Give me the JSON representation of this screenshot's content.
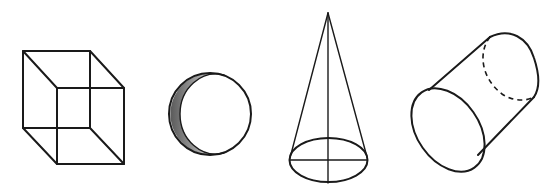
{
  "figure": {
    "description": "Four line drawings of 3D geometric solids arranged left to right",
    "background": "#ffffff",
    "ink": "#1a1a1a",
    "shapes": [
      {
        "name": "cube",
        "label": "Cube",
        "style": "wireframe (Necker cube), all edges visible"
      },
      {
        "name": "sphere",
        "label": "Sphere",
        "style": "circle outline with shaded crescent on left side"
      },
      {
        "name": "cone",
        "label": "Cone",
        "style": "apex at top, elliptical base with vertical axis and horizontal diameter"
      },
      {
        "name": "cylinder",
        "label": "Cylinder",
        "style": "tilted, front ellipse solid, hidden back edge dashed"
      }
    ]
  }
}
